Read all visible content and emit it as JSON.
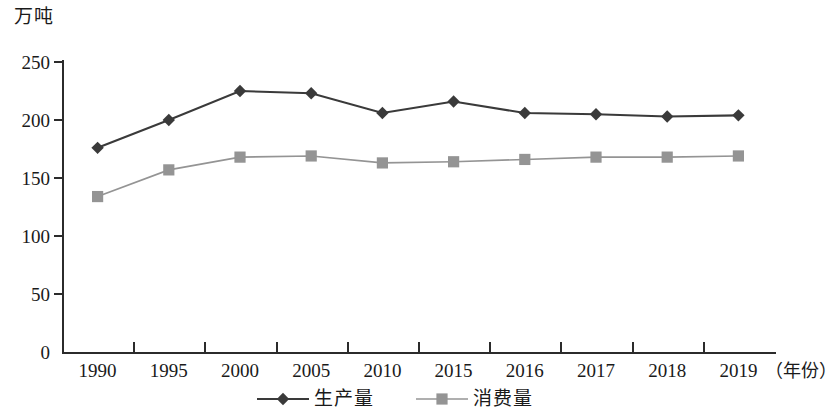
{
  "chart_data": {
    "type": "line",
    "title": "",
    "ylabel": "万吨",
    "xlabel": "（年份）",
    "categories": [
      "1990",
      "1995",
      "2000",
      "2005",
      "2010",
      "2015",
      "2016",
      "2017",
      "2018",
      "2019"
    ],
    "series": [
      {
        "name": "生产量",
        "marker": "diamond",
        "color": "#3a3a3a",
        "values": [
          176,
          200,
          225,
          223,
          206,
          216,
          206,
          205,
          203,
          204
        ]
      },
      {
        "name": "消费量",
        "marker": "square",
        "color": "#949494",
        "values": [
          134,
          157,
          168,
          169,
          163,
          164,
          166,
          168,
          168,
          169
        ]
      }
    ],
    "yticks": [
      0,
      50,
      100,
      150,
      200,
      250
    ],
    "ylim": [
      0,
      250
    ],
    "grid": false,
    "legend_position": "bottom"
  },
  "axes": {
    "y_unit_caption": "万吨",
    "x_unit_caption": "（年份）",
    "y_tick_labels": [
      "250",
      "200",
      "150",
      "100",
      "50",
      "0"
    ],
    "x_tick_labels": [
      "1990",
      "1995",
      "2000",
      "2005",
      "2010",
      "2015",
      "2016",
      "2017",
      "2018",
      "2019"
    ]
  },
  "legend": {
    "items": [
      {
        "label": "生产量",
        "marker": "diamond",
        "color": "#3a3a3a"
      },
      {
        "label": "消费量",
        "marker": "square",
        "color": "#949494"
      }
    ]
  },
  "colors": {
    "axis": "#2b2b2b",
    "production": "#3a3a3a",
    "consumption": "#949494",
    "background": "#ffffff"
  }
}
